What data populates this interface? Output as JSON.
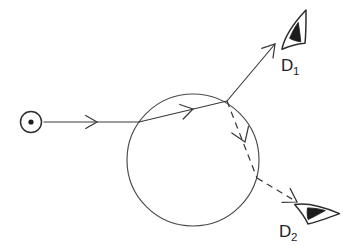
{
  "figure": {
    "background_color": "#ffffff",
    "ink_color": "#3a3a3a",
    "width": 345,
    "height": 246
  },
  "source": {
    "name": "point-light-source",
    "symbol": "circled-dot",
    "glyph": "⊙",
    "center_x": 31,
    "center_y": 122,
    "outer_radius": 10.5,
    "inner_radius": 2.6
  },
  "medium": {
    "name": "spherical-medium",
    "shape": "circle",
    "center_x": 193,
    "center_y": 160,
    "radius": 66,
    "stroke_color": "#4a4a4a"
  },
  "rays": {
    "incident": {
      "name": "incident-ray",
      "style": "solid",
      "from_x": 44,
      "from_y": 122,
      "to_x": 139,
      "to_y": 122,
      "arrow_at_x": 97,
      "arrow_at_y": 122,
      "arrow_angle_deg": 0
    },
    "internal_solid": {
      "name": "internal-refracted-chord",
      "style": "solid",
      "from_x": 139,
      "from_y": 122,
      "to_x": 227,
      "to_y": 101,
      "arrow_at_x": 193,
      "arrow_at_y": 109,
      "arrow_angle_deg": -13.4
    },
    "reflected_to_d1": {
      "name": "ray-to-detector-1",
      "style": "solid",
      "from_x": 227,
      "from_y": 101,
      "to_x": 275,
      "to_y": 44,
      "arrow_at_x": 275,
      "arrow_at_y": 44,
      "arrow_angle_deg": -49.9
    },
    "internal_dashed": {
      "name": "internal-reflected-dashed-chord",
      "style": "dashed",
      "from_x": 227,
      "from_y": 101,
      "to_x": 257,
      "to_y": 178,
      "arrow_at_x": 245,
      "arrow_at_y": 142,
      "arrow_angle_deg": 68.7
    },
    "exit_to_d2": {
      "name": "ray-to-detector-2",
      "style": "dashed",
      "from_x": 257,
      "from_y": 178,
      "to_x": 297,
      "to_y": 202,
      "arrow_at_x": 297,
      "arrow_at_y": 202,
      "arrow_angle_deg": 31.0
    }
  },
  "detectors": [
    {
      "id": "d1",
      "name": "detector-1",
      "label": "D",
      "subscript": "1",
      "symbol": "eye",
      "eye_x": 297,
      "eye_y": 33,
      "eye_rotation_deg": -42,
      "label_x": 281,
      "label_y": 71
    },
    {
      "id": "d2",
      "name": "detector-2",
      "label": "D",
      "subscript": "2",
      "symbol": "eye",
      "eye_x": 315,
      "eye_y": 213,
      "eye_rotation_deg": 28,
      "label_x": 279,
      "label_y": 237
    }
  ]
}
